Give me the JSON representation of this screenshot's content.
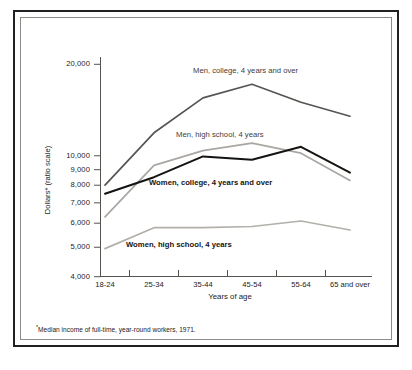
{
  "figure": {
    "y_axis_title": "Dollars* (ratio scale)",
    "x_axis_title": "Years of age",
    "footnote_marker": "*",
    "footnote_text": "Median income of full-time, year-round workers, 1971."
  },
  "chart_data": {
    "type": "line",
    "title": "",
    "subtitle": "",
    "xlabel": "Years of age",
    "ylabel": "Dollars* (ratio scale)",
    "scale": "log",
    "grid": false,
    "legend_position": "inline-annotations",
    "categories": [
      "18-24",
      "25-34",
      "35-44",
      "45-54",
      "55-64",
      "65 and over"
    ],
    "ytick_labels": [
      "20,000",
      "10,000",
      "9,000",
      "8,000",
      "7,000",
      "6,000",
      "5,000",
      "4,000"
    ],
    "yticks": [
      20000,
      10000,
      9000,
      8000,
      7000,
      6000,
      5000,
      4000
    ],
    "ylim": [
      4000,
      22000
    ],
    "series": [
      {
        "name": "Men, college, 4 years and over",
        "color": "#575451",
        "width": 1.7,
        "values": [
          8000,
          11900,
          15500,
          17200,
          15000,
          13500
        ]
      },
      {
        "name": "Men, high school, 4 years",
        "color": "#aaa7a3",
        "width": 1.7,
        "values": [
          6300,
          9300,
          10400,
          11000,
          10200,
          8300
        ]
      },
      {
        "name": "Women, college, 4 years and over",
        "color": "#161412",
        "width": 2.0,
        "values": [
          7500,
          8500,
          9950,
          9700,
          10700,
          8800
        ]
      },
      {
        "name": "Women, high school, 4 years",
        "color": "#b3b0ac",
        "width": 1.7,
        "values": [
          4950,
          5800,
          5800,
          5850,
          6100,
          5700
        ]
      }
    ],
    "annotations": [
      {
        "text": "Men, college, 4 years and over",
        "series": "Men, college, 4 years and over"
      },
      {
        "text": "Men, high school, 4 years",
        "series": "Men, high school, 4 years"
      },
      {
        "text": "Women, college, 4 years and over",
        "series": "Women, college, 4 years and over"
      },
      {
        "text": "Women, high school, 4 years",
        "series": "Women, high school, 4 years"
      }
    ]
  }
}
